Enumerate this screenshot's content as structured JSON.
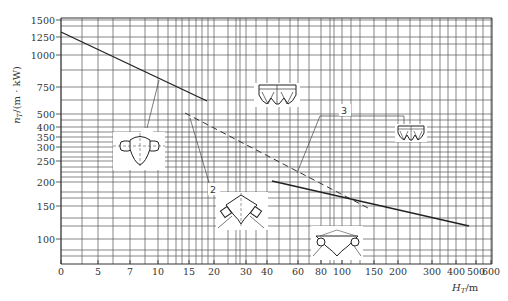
{
  "chart_data": {
    "type": "line",
    "title": "",
    "xlabel": "H_T/m",
    "ylabel": "n_T/(m·kW)",
    "x_scale": "nonlinear (log-like)",
    "y_scale": "log",
    "x_ticks": [
      "0",
      "5",
      "7",
      "10",
      "15",
      "20",
      "30",
      "40",
      "60",
      "80",
      "100",
      "150",
      "200",
      "300",
      "400",
      "500",
      "600"
    ],
    "y_ticks": [
      "1500",
      "1250",
      "1000",
      "750",
      "500",
      "400",
      "350",
      "300",
      "250",
      "200",
      "150",
      "100"
    ],
    "xlim": [
      0,
      600
    ],
    "ylim": [
      75,
      1500
    ],
    "grid": true,
    "legend": "none (curves labeled 1, 2, 3 with leader lines and machine cross-section sketches)",
    "series": [
      {
        "name": "1",
        "style": "solid",
        "x": [
          0,
          10,
          19
        ],
        "y": [
          1350,
          760,
          580
        ]
      },
      {
        "name": "2",
        "style": "dashed",
        "x": [
          15,
          30,
          60,
          140
        ],
        "y": [
          480,
          350,
          300,
          210
        ]
      },
      {
        "name": "3",
        "style": "solid",
        "x": [
          30,
          100,
          200,
          500
        ],
        "y": [
          290,
          215,
          175,
          120
        ]
      }
    ],
    "annotations": [
      "1",
      "2",
      "3"
    ]
  },
  "axes": {
    "x_label_main": "H",
    "x_label_sub": "T",
    "x_label_unit": "/m",
    "y_label_main": "n",
    "y_label_sub": "T",
    "y_label_unit": "/(m · kW)"
  },
  "curve_labels": {
    "c1": "1",
    "c2": "2",
    "c3": "3"
  }
}
